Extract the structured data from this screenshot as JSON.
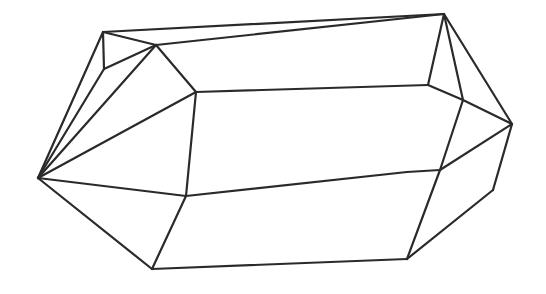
{
  "figure": {
    "stroke_color": "#2a2a2a",
    "background": "#ffffff",
    "vertices": {
      "L": [
        38,
        178
      ],
      "A": [
        103,
        32
      ],
      "B": [
        156,
        45
      ],
      "C": [
        104,
        69
      ],
      "D": [
        196,
        92
      ],
      "E": [
        444,
        14
      ],
      "F": [
        428,
        85
      ],
      "G": [
        463,
        100
      ],
      "H": [
        512,
        124
      ],
      "I": [
        440,
        170
      ],
      "J": [
        407,
        172
      ],
      "K": [
        186,
        196
      ],
      "M": [
        152,
        269
      ],
      "N": [
        407,
        259
      ],
      "O": [
        493,
        190
      ]
    },
    "edges": [
      [
        "A",
        "E"
      ],
      [
        "B",
        "E"
      ],
      [
        "A",
        "B"
      ],
      [
        "A",
        "C"
      ],
      [
        "C",
        "B"
      ],
      [
        "A",
        "L"
      ],
      [
        "C",
        "L"
      ],
      [
        "B",
        "L"
      ],
      [
        "B",
        "D"
      ],
      [
        "D",
        "L"
      ],
      [
        "D",
        "F"
      ],
      [
        "F",
        "E"
      ],
      [
        "E",
        "G"
      ],
      [
        "E",
        "H"
      ],
      [
        "F",
        "G"
      ],
      [
        "G",
        "H"
      ],
      [
        "G",
        "I"
      ],
      [
        "H",
        "I"
      ],
      [
        "H",
        "O"
      ],
      [
        "D",
        "K"
      ],
      [
        "L",
        "K"
      ],
      [
        "K",
        "J"
      ],
      [
        "J",
        "I"
      ],
      [
        "I",
        "N"
      ],
      [
        "O",
        "N"
      ],
      [
        "L",
        "M"
      ],
      [
        "K",
        "M"
      ],
      [
        "M",
        "N"
      ]
    ]
  }
}
